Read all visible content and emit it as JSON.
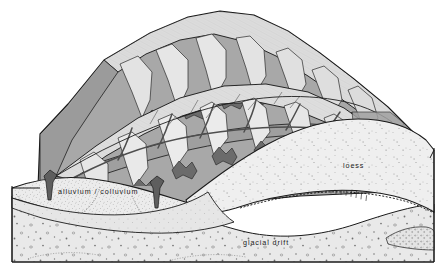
{
  "figure": {
    "type": "geologic-block-diagram",
    "width": 446,
    "height": 274,
    "background_color": "#ffffff"
  },
  "labels": {
    "alluvium_colluvium": "alluvium / colluvium",
    "loess": "loess",
    "glacial_drift": "glacial drift"
  },
  "caption": {
    "text": ""
  },
  "colors": {
    "paper": "#ffffff",
    "ink": "#1a1a1a",
    "ridge_light": "#dcdcdc",
    "ridge_highlight": "#e8e8e8",
    "valley_midgray": "#a8a8a8",
    "valley_shadow": "#999999",
    "channel_dark": "#6b6b6b",
    "alluvium_fill": "#ececec",
    "loess_fill": "#efefef",
    "drift_fill": "#e9e9e9",
    "band_fill": "#e4e4e4",
    "stipple": "#8e8e8e",
    "clast": "#6f6f6f"
  },
  "units": [
    {
      "id": "alluvium-colluvium",
      "name": "alluvium / colluvium",
      "position": "upper valley fill, left half of section",
      "pattern": "fine stipple",
      "fill": "#ececec"
    },
    {
      "id": "loess",
      "name": "loess",
      "position": "draped mantle, right half of section",
      "pattern": "sparse stipple",
      "fill": "#efefef"
    },
    {
      "id": "glacial-drift",
      "name": "glacial drift",
      "position": "basal unit across full section",
      "pattern": "scattered clasts and pebbles",
      "fill": "#e9e9e9"
    }
  ],
  "features": {
    "ridges": "dissected upland with radiating spur ridges and hachured slopes",
    "drainage": "dendritic valley network floored in mid-gray",
    "paleosol_marker": "tick-mark row along the loess / drift contact",
    "sand_lens": "stippled lens at lower right of the drift"
  }
}
